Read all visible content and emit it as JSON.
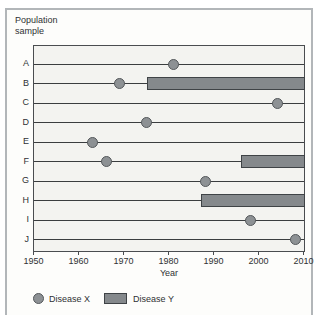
{
  "figure": {
    "corner_label": "Population sample"
  },
  "chart_data": {
    "type": "scatter",
    "title": "Population sample",
    "xlabel": "Year",
    "ylabel": "Population sample",
    "xlim": [
      1950,
      2010
    ],
    "xticks": [
      1950,
      1960,
      1970,
      1980,
      1990,
      2000,
      2010
    ],
    "categories": [
      "A",
      "B",
      "C",
      "D",
      "E",
      "F",
      "G",
      "H",
      "I",
      "J"
    ],
    "grid": "horizontal-row-lines",
    "legend_position": "bottom-left",
    "series": [
      {
        "name": "Disease X",
        "type": "scatter",
        "marker": "circle",
        "color": "#8d9194",
        "border_color": "#54585b",
        "points": [
          {
            "sample": "A",
            "year": 1981
          },
          {
            "sample": "B",
            "year": 1969
          },
          {
            "sample": "C",
            "year": 2004
          },
          {
            "sample": "D",
            "year": 1975
          },
          {
            "sample": "E",
            "year": 1963
          },
          {
            "sample": "F",
            "year": 1966
          },
          {
            "sample": "G",
            "year": 1988
          },
          {
            "sample": "I",
            "year": 1998
          },
          {
            "sample": "J",
            "year": 2008
          }
        ]
      },
      {
        "name": "Disease Y",
        "type": "bar",
        "color": "#85898c",
        "border_color": "#3f4346",
        "ranges": [
          {
            "sample": "B",
            "start": 1975,
            "end": 2010
          },
          {
            "sample": "F",
            "start": 1996,
            "end": 2010
          },
          {
            "sample": "H",
            "start": 1987,
            "end": 2010
          }
        ]
      }
    ]
  },
  "colors": {
    "frame_border": "#b2b6b9",
    "panel_bg": "#fdfdfb",
    "plot_bg": "#f3f3f0",
    "row_line": "#3a3d3f",
    "text": "#2f3133"
  }
}
